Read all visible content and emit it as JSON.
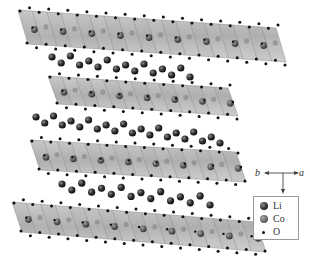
{
  "figure": {
    "structure": {
      "slabs": [
        {
          "id": "slab-1",
          "x0": 18,
          "y0": 10,
          "x1": 276,
          "y1": 28,
          "thickness": 34
        },
        {
          "id": "slab-2",
          "x0": 48,
          "y0": 76,
          "x1": 228,
          "y1": 88,
          "thickness": 28
        },
        {
          "id": "slab-3",
          "x0": 30,
          "y0": 140,
          "x1": 236,
          "y1": 152,
          "thickness": 30
        },
        {
          "id": "slab-4",
          "x0": 12,
          "y0": 202,
          "x1": 256,
          "y1": 222,
          "thickness": 30
        }
      ],
      "li_rows": [
        {
          "id": "li-row-1",
          "x0": 52,
          "y0": 57,
          "x1": 190,
          "y1": 72,
          "count": 16
        },
        {
          "id": "li-row-2",
          "x0": 36,
          "y0": 117,
          "x1": 220,
          "y1": 138,
          "count": 22
        },
        {
          "id": "li-row-3",
          "x0": 62,
          "y0": 184,
          "x1": 210,
          "y1": 200,
          "count": 16
        }
      ]
    },
    "axes": {
      "b_label": "b",
      "a_label": "a",
      "c_label": "c",
      "origin": {
        "x": 283,
        "y": 174
      }
    },
    "legend": {
      "items": [
        {
          "label": "Li",
          "color": "#2b2b2b",
          "size": 7
        },
        {
          "label": "Co",
          "color": "#6e6e6e",
          "size": 7
        },
        {
          "label": "O",
          "color": "#111111",
          "size": 3
        }
      ]
    },
    "colors": {
      "slab_fill": "#9c9c9c",
      "slab_edge": "#7a7a7a",
      "li": "#2b2b2b",
      "co": "#5e5e5e",
      "o": "#111111"
    }
  }
}
